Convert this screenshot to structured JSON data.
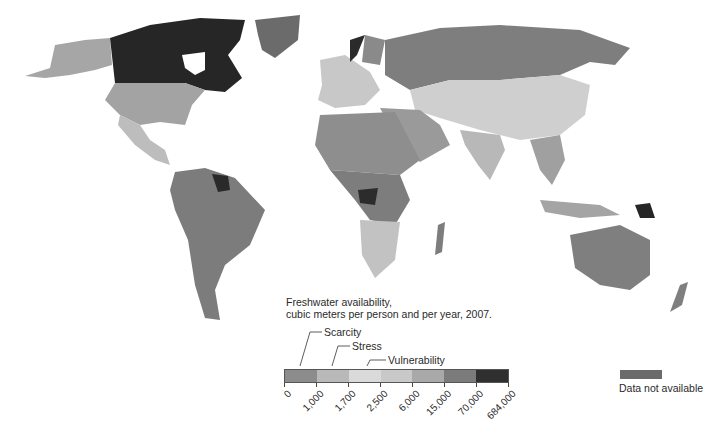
{
  "legend": {
    "title_line1": "Freshwater availability,",
    "title_line2": "cubic meters per person and per year, 2007.",
    "categories": [
      {
        "label": "Scarcity",
        "range": "0 - 1,000"
      },
      {
        "label": "Stress",
        "range": "1,000 - 1,700"
      },
      {
        "label": "Vulnerability",
        "range": "1,700 - 2,500"
      }
    ],
    "bands": [
      {
        "from": "0",
        "to": "1,000",
        "color": "#8c8c8c"
      },
      {
        "from": "1,000",
        "to": "1,700",
        "color": "#b9b9b9"
      },
      {
        "from": "1,700",
        "to": "2,500",
        "color": "#dadada"
      },
      {
        "from": "2,500",
        "to": "6,000",
        "color": "#c9c9c9"
      },
      {
        "from": "6,000",
        "to": "15,000",
        "color": "#a9a9a9"
      },
      {
        "from": "15,000",
        "to": "70,000",
        "color": "#7b7b7b"
      },
      {
        "from": "70,000",
        "to": "684,000",
        "color": "#2f2f2f"
      }
    ],
    "ticks": [
      "0",
      "1,000",
      "1,700",
      "2,500",
      "6,000",
      "15,000",
      "70,000",
      "684,000"
    ],
    "no_data": {
      "label": "Data not available",
      "color": "#6b6b6b"
    }
  },
  "map": {
    "regions": [
      {
        "name": "Canada",
        "band": "70,000 - 684,000"
      },
      {
        "name": "Alaska / United States",
        "band": "6,000 - 15,000"
      },
      {
        "name": "Greenland",
        "band": "Data not available"
      },
      {
        "name": "Mexico",
        "band": "2,500 - 6,000"
      },
      {
        "name": "South America",
        "band": "15,000 - 70,000"
      },
      {
        "name": "Guyana / Suriname",
        "band": "70,000 - 684,000"
      },
      {
        "name": "Russia",
        "band": "15,000 - 70,000"
      },
      {
        "name": "Norway",
        "band": "70,000 - 684,000"
      },
      {
        "name": "Europe",
        "band": "2,500 - 6,000"
      },
      {
        "name": "North Africa",
        "band": "0 - 1,000"
      },
      {
        "name": "Arabian Peninsula",
        "band": "0 - 1,000"
      },
      {
        "name": "Central Asia / China",
        "band": "1,700 - 2,500"
      },
      {
        "name": "India",
        "band": "1,000 - 1,700"
      },
      {
        "name": "Congo / Gabon",
        "band": "70,000 - 684,000"
      },
      {
        "name": "Central Africa",
        "band": "15,000 - 70,000"
      },
      {
        "name": "Southern Africa",
        "band": "2,500 - 6,000"
      },
      {
        "name": "Madagascar",
        "band": "15,000 - 70,000"
      },
      {
        "name": "Southeast Asia",
        "band": "6,000 - 15,000"
      },
      {
        "name": "Papua New Guinea",
        "band": "70,000 - 684,000"
      },
      {
        "name": "Australia",
        "band": "15,000 - 70,000"
      },
      {
        "name": "New Zealand",
        "band": "15,000 - 70,000"
      }
    ]
  }
}
